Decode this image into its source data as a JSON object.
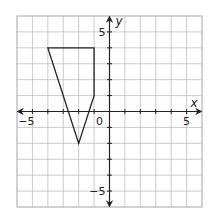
{
  "chart_data": {
    "type": "scatter",
    "title": "",
    "xlabel": "x",
    "ylabel": "y",
    "xlim": [
      -6,
      6
    ],
    "ylim": [
      -6,
      6
    ],
    "grid": true,
    "grid_step": 1,
    "x_tick_labels": [
      {
        "value": -5,
        "label": "−5"
      },
      {
        "value": 0,
        "label": "0"
      },
      {
        "value": 5,
        "label": "5"
      }
    ],
    "y_tick_labels": [
      {
        "value": 5,
        "label": "5"
      },
      {
        "value": -5,
        "label": "−5"
      }
    ],
    "series": [
      {
        "name": "quadrilateral",
        "kind": "polygon",
        "points": [
          [
            -4,
            4
          ],
          [
            -1,
            4
          ],
          [
            -1,
            1
          ],
          [
            -2,
            -2
          ]
        ]
      }
    ],
    "legend": null
  },
  "colors": {
    "grid": "#c4c4c4",
    "axis": "#222222",
    "shape": "#222222",
    "background": "#ffffff"
  }
}
